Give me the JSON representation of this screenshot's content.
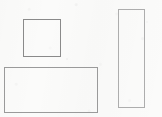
{
  "figure": {
    "canvas": {
      "width": 162,
      "height": 117,
      "background_color": "#fbfbfa",
      "paper_texture": "faint-scan-noise"
    },
    "shapes": [
      {
        "id": "square",
        "name": "square-shape",
        "label": "Square",
        "x": 23,
        "y": 19,
        "width": 38,
        "height": 38,
        "stroke_color": "#8a8a8a",
        "stroke_width": 1.5,
        "fill": "none"
      },
      {
        "id": "wide-rectangle",
        "name": "wide-rectangle-shape",
        "label": "Wide rectangle",
        "x": 4,
        "y": 67,
        "width": 94,
        "height": 46,
        "stroke_color": "#9a9a9a",
        "stroke_width": 1.2,
        "fill": "none"
      },
      {
        "id": "tall-rectangle",
        "name": "tall-rectangle-shape",
        "label": "Tall rectangle",
        "x": 118,
        "y": 9,
        "width": 27,
        "height": 99,
        "stroke_color": "#adadad",
        "stroke_width": 1.2,
        "fill": "none"
      }
    ],
    "artifacts": [
      {
        "id": "speck-1",
        "name": "scan-speck",
        "x": 66,
        "y": 58,
        "opacity": 0.2
      },
      {
        "id": "speck-2",
        "name": "scan-speck",
        "x": 146,
        "y": 21,
        "opacity": 0.14
      }
    ]
  }
}
